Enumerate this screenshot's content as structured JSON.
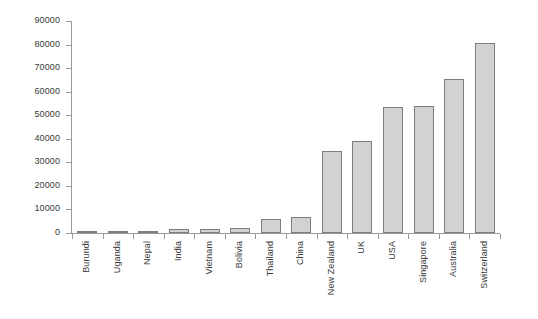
{
  "chart_data": {
    "type": "bar",
    "title": "",
    "subtitle": "",
    "xlabel": "",
    "ylabel": "",
    "ylim": [
      0,
      90000
    ],
    "ytick_step": 10000,
    "grid": false,
    "legend": false,
    "legend_position": "none",
    "bar_fill_color": "#d2d2d2",
    "bar_border_color": "#7d7d7d",
    "axis_color": "#9a9a9a",
    "text_color": "#3a3a3a",
    "background_color": "#ffffff",
    "categories": [
      "Burundi",
      "Uganda",
      "Nepal",
      "India",
      "Vietnam",
      "Bolivia",
      "Thailand",
      "China",
      "New Zealand",
      "UK",
      "USA",
      "Singapore",
      "Australia",
      "Switzerland"
    ],
    "values": [
      300,
      800,
      1000,
      1500,
      1600,
      2200,
      5900,
      6800,
      35000,
      39000,
      53500,
      53800,
      65500,
      80500
    ],
    "ytick_labels": [
      "90000",
      "80000",
      "70000",
      "60000",
      "50000",
      "40000",
      "30000",
      "20000",
      "10000",
      "0"
    ],
    "ytick_values": [
      90000,
      80000,
      70000,
      60000,
      50000,
      40000,
      30000,
      20000,
      10000,
      0
    ]
  }
}
